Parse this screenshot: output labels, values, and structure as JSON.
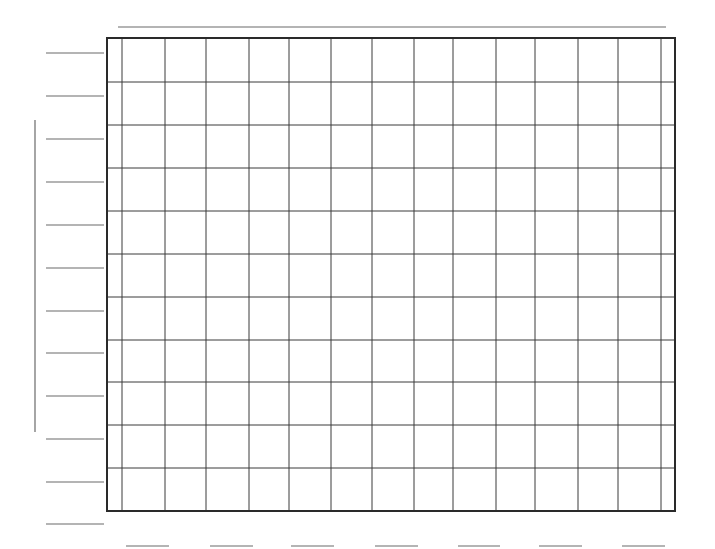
{
  "worksheet": {
    "type": "blank-graph-template",
    "title_blank": {
      "x1": 118,
      "x2": 666,
      "y": 27
    },
    "y_axis_label_blank": {
      "x": 35,
      "y1": 120,
      "y2": 432
    },
    "y_tick_label_blanks_y": [
      53,
      96,
      139,
      182,
      225,
      268,
      311,
      353,
      396,
      439,
      482,
      524
    ],
    "y_tick_label_blank_x": [
      46,
      104
    ],
    "x_tick_label_blanks": [
      {
        "x1": 126,
        "x2": 169
      },
      {
        "x1": 210,
        "x2": 253
      },
      {
        "x1": 291,
        "x2": 334
      },
      {
        "x1": 375,
        "x2": 418
      },
      {
        "x1": 458,
        "x2": 500
      },
      {
        "x1": 539,
        "x2": 582
      },
      {
        "x1": 622,
        "x2": 665
      }
    ],
    "x_tick_label_blank_y": 546
  },
  "grid": {
    "left": 107,
    "top": 38,
    "right": 675,
    "bottom": 511,
    "vertical_lines_x": [
      122,
      165,
      206,
      249,
      289,
      331,
      372,
      414,
      453,
      496,
      535,
      578,
      618,
      661
    ],
    "horizontal_lines_y": [
      82,
      125,
      168,
      211,
      254,
      297,
      340,
      382,
      425,
      468
    ],
    "border_color": "#2a2a2a",
    "line_color": "#3a3a3a",
    "blank_line_color": "#6a6a6a"
  },
  "chart_data": {
    "type": "line",
    "title": "",
    "xlabel": "",
    "ylabel": "",
    "categories": [],
    "series": [],
    "grid": true,
    "note": "Blank graph paper template: 14 columns x 11 rows, with empty label lines for title, axis label, and tick labels"
  }
}
